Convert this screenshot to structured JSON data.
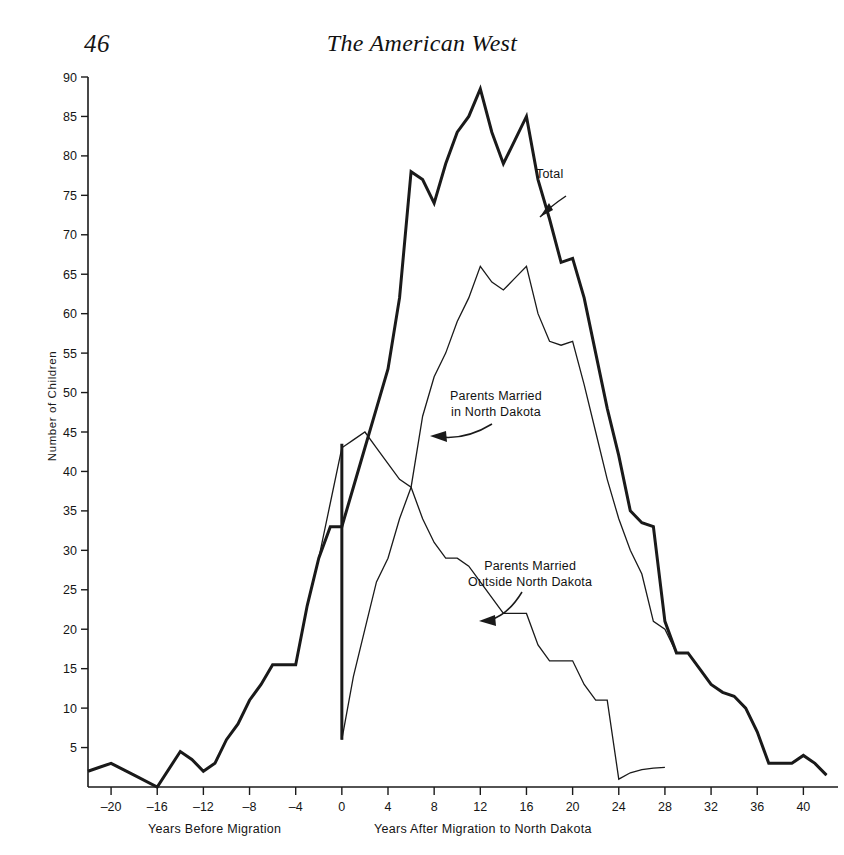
{
  "header": {
    "page_number": "46",
    "running_title": "The American West"
  },
  "axis": {
    "y_label": "Number of Children",
    "x_caption_left": "Years Before Migration",
    "x_caption_right": "Years After Migration to North Dakota",
    "y_ticks": [
      "0",
      "5",
      "10",
      "15",
      "20",
      "25",
      "30",
      "35",
      "40",
      "45",
      "50",
      "55",
      "60",
      "65",
      "70",
      "75",
      "80",
      "85",
      "90"
    ],
    "x_ticks": [
      "-20",
      "-16",
      "-12",
      "-8",
      "-4",
      "0",
      "4",
      "8",
      "12",
      "16",
      "20",
      "24",
      "28",
      "32",
      "36",
      "40"
    ]
  },
  "annotations": {
    "total": "Total",
    "married_in_nd_l1": "Parents Married",
    "married_in_nd_l2": "in North Dakota",
    "married_outside_nd_l1": "Parents Married",
    "married_outside_nd_l2": "Outside North Dakota"
  },
  "chart_data": {
    "type": "line",
    "xlabel": "Years Before / After Migration to North Dakota",
    "ylabel": "Number of Children",
    "xlim": [
      -22,
      43
    ],
    "ylim": [
      0,
      90
    ],
    "xtick_step": 4,
    "ytick_step": 5,
    "grid": false,
    "legend": "inline-annotations",
    "series": [
      {
        "name": "Total",
        "annotation": "Total",
        "linewidth": "thick",
        "points": [
          [
            -22,
            2
          ],
          [
            -21,
            2.5
          ],
          [
            -20,
            3
          ],
          [
            -18,
            1.5
          ],
          [
            -16,
            0
          ],
          [
            -14,
            4.5
          ],
          [
            -13,
            3.5
          ],
          [
            -12,
            2
          ],
          [
            -11,
            3
          ],
          [
            -10,
            6
          ],
          [
            -9,
            8
          ],
          [
            -8,
            11
          ],
          [
            -7,
            13
          ],
          [
            -6,
            15.5
          ],
          [
            -5,
            15.5
          ],
          [
            -4,
            15.5
          ],
          [
            -3,
            23
          ],
          [
            -2,
            29
          ],
          [
            -1,
            33
          ],
          [
            0,
            33
          ],
          [
            1,
            38
          ],
          [
            2,
            43
          ],
          [
            3,
            48
          ],
          [
            4,
            53
          ],
          [
            5,
            62
          ],
          [
            6,
            78
          ],
          [
            7,
            77
          ],
          [
            8,
            74
          ],
          [
            9,
            79
          ],
          [
            10,
            83
          ],
          [
            11,
            85
          ],
          [
            12,
            88.5
          ],
          [
            13,
            83
          ],
          [
            14,
            79
          ],
          [
            15,
            82
          ],
          [
            16,
            85
          ],
          [
            17,
            77
          ],
          [
            18,
            72
          ],
          [
            19,
            66.5
          ],
          [
            20,
            67
          ],
          [
            21,
            62
          ],
          [
            22,
            55
          ],
          [
            23,
            48
          ],
          [
            24,
            42
          ],
          [
            25,
            35
          ],
          [
            26,
            33.5
          ],
          [
            27,
            33
          ],
          [
            28,
            21
          ],
          [
            29,
            17
          ],
          [
            30,
            17
          ],
          [
            31,
            15
          ],
          [
            32,
            13
          ],
          [
            33,
            12
          ],
          [
            34,
            11.5
          ],
          [
            35,
            10
          ],
          [
            36,
            7
          ],
          [
            37,
            3
          ],
          [
            38,
            3
          ],
          [
            39,
            3
          ],
          [
            40,
            4
          ],
          [
            41,
            3
          ],
          [
            42,
            1.5
          ]
        ]
      },
      {
        "name": "Parents Married in North Dakota",
        "annotation": "Parents Married in North Dakota",
        "linewidth": "thin",
        "points": [
          [
            0,
            6
          ],
          [
            1,
            14
          ],
          [
            2,
            20
          ],
          [
            3,
            26
          ],
          [
            4,
            29
          ],
          [
            5,
            34
          ],
          [
            6,
            38
          ],
          [
            7,
            47
          ],
          [
            8,
            52
          ],
          [
            9,
            55
          ],
          [
            10,
            59
          ],
          [
            11,
            62
          ],
          [
            12,
            66
          ],
          [
            13,
            64
          ],
          [
            14,
            63
          ],
          [
            15,
            64.5
          ],
          [
            16,
            66
          ],
          [
            17,
            60
          ],
          [
            18,
            56.5
          ],
          [
            19,
            56
          ],
          [
            20,
            56.5
          ],
          [
            21,
            51
          ],
          [
            22,
            45
          ],
          [
            23,
            39
          ],
          [
            24,
            34
          ],
          [
            25,
            30
          ],
          [
            26,
            27
          ],
          [
            27,
            21
          ],
          [
            28,
            20
          ],
          [
            29,
            17
          ],
          [
            30,
            17
          ],
          [
            31,
            15
          ],
          [
            32,
            13
          ],
          [
            33,
            12
          ],
          [
            34,
            11.5
          ],
          [
            35,
            10
          ],
          [
            36,
            7
          ],
          [
            37,
            3
          ],
          [
            38,
            3
          ],
          [
            39,
            3
          ],
          [
            40,
            4
          ],
          [
            41,
            3
          ],
          [
            42,
            1.5
          ]
        ]
      },
      {
        "name": "Parents Married Outside North Dakota",
        "annotation": "Parents Married Outside North Dakota",
        "linewidth": "thin",
        "points": [
          [
            -22,
            2
          ],
          [
            -21,
            2.5
          ],
          [
            -20,
            3
          ],
          [
            -18,
            1.5
          ],
          [
            -16,
            0
          ],
          [
            -14,
            4.5
          ],
          [
            -13,
            3.5
          ],
          [
            -12,
            2
          ],
          [
            -11,
            3
          ],
          [
            -10,
            6
          ],
          [
            -9,
            8
          ],
          [
            -8,
            11
          ],
          [
            -7,
            13
          ],
          [
            -6,
            15.5
          ],
          [
            -5,
            15.5
          ],
          [
            -4,
            15.5
          ],
          [
            -3,
            23
          ],
          [
            -2,
            29
          ],
          [
            -1,
            36
          ],
          [
            0,
            43
          ],
          [
            1,
            44
          ],
          [
            2,
            45
          ],
          [
            3,
            43
          ],
          [
            4,
            41
          ],
          [
            5,
            39
          ],
          [
            6,
            38
          ],
          [
            7,
            34
          ],
          [
            8,
            31
          ],
          [
            9,
            29
          ],
          [
            10,
            29
          ],
          [
            11,
            28
          ],
          [
            12,
            26
          ],
          [
            13,
            24
          ],
          [
            14,
            22
          ],
          [
            15,
            22
          ],
          [
            16,
            22
          ],
          [
            17,
            18
          ],
          [
            18,
            16
          ],
          [
            19,
            16
          ],
          [
            20,
            16
          ],
          [
            21,
            13
          ],
          [
            22,
            11
          ],
          [
            23,
            11
          ],
          [
            24,
            1
          ],
          [
            25,
            1.8
          ],
          [
            26,
            2.2
          ],
          [
            27,
            2.4
          ],
          [
            28,
            2.5
          ]
        ]
      }
    ]
  }
}
